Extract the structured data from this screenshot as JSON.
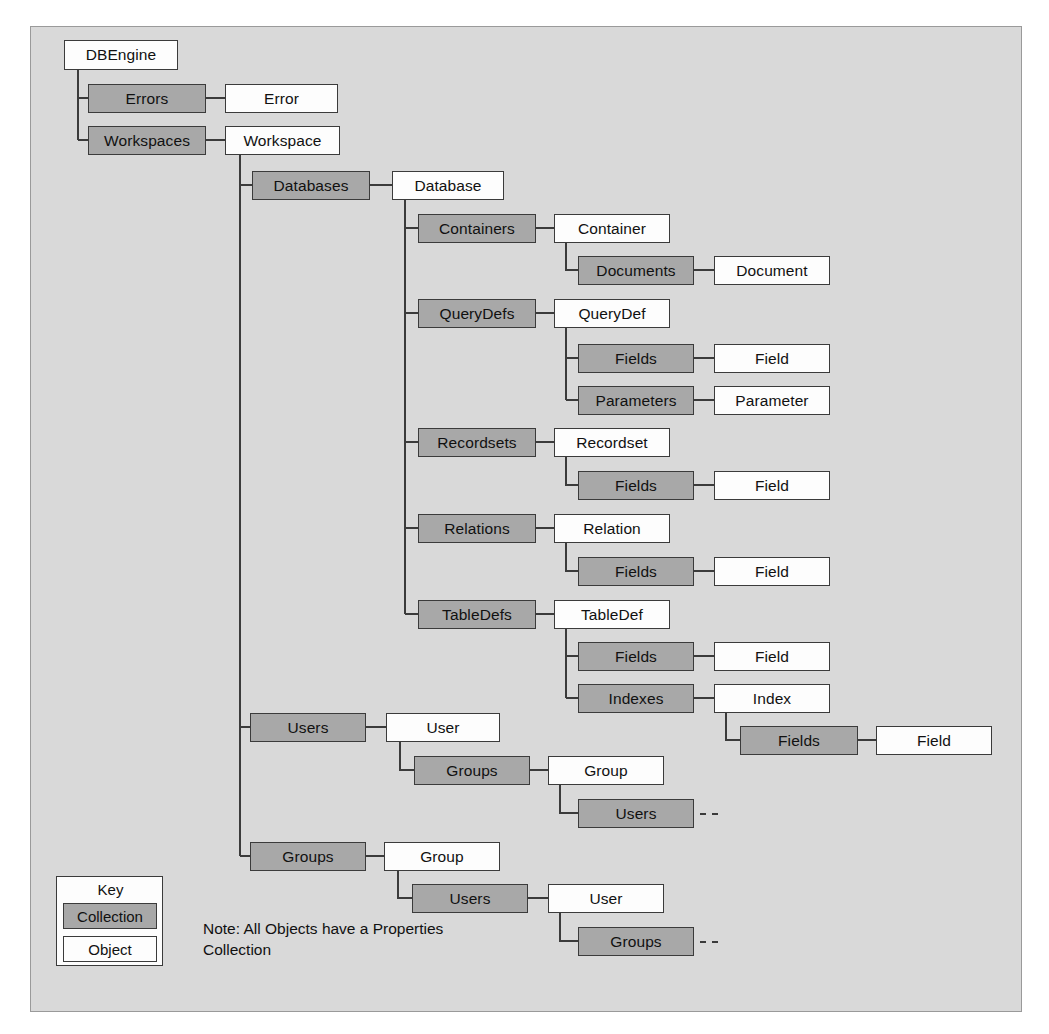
{
  "diagram": {
    "style": {
      "background": "#d9d9d9",
      "collection_fill": "#a8a8a8",
      "object_fill": "#fdfdfd",
      "border": "#3b3b3b"
    },
    "nodes": [
      {
        "id": "dbengine",
        "label": "DBEngine",
        "kind": "object",
        "x": 64,
        "y": 40,
        "w": 114,
        "h": 30
      },
      {
        "id": "errors",
        "label": "Errors",
        "kind": "collection",
        "x": 88,
        "y": 84,
        "w": 118,
        "h": 29
      },
      {
        "id": "error",
        "label": "Error",
        "kind": "object",
        "x": 225,
        "y": 84,
        "w": 113,
        "h": 29
      },
      {
        "id": "workspaces",
        "label": "Workspaces",
        "kind": "collection",
        "x": 88,
        "y": 126,
        "w": 118,
        "h": 29
      },
      {
        "id": "workspace",
        "label": "Workspace",
        "kind": "object",
        "x": 225,
        "y": 126,
        "w": 115,
        "h": 29
      },
      {
        "id": "databases",
        "label": "Databases",
        "kind": "collection",
        "x": 252,
        "y": 171,
        "w": 118,
        "h": 29
      },
      {
        "id": "database",
        "label": "Database",
        "kind": "object",
        "x": 392,
        "y": 171,
        "w": 112,
        "h": 29
      },
      {
        "id": "containers",
        "label": "Containers",
        "kind": "collection",
        "x": 418,
        "y": 214,
        "w": 118,
        "h": 29
      },
      {
        "id": "container",
        "label": "Container",
        "kind": "object",
        "x": 554,
        "y": 214,
        "w": 116,
        "h": 29
      },
      {
        "id": "documents",
        "label": "Documents",
        "kind": "collection",
        "x": 578,
        "y": 256,
        "w": 116,
        "h": 29
      },
      {
        "id": "document",
        "label": "Document",
        "kind": "object",
        "x": 714,
        "y": 256,
        "w": 116,
        "h": 29
      },
      {
        "id": "querydefs",
        "label": "QueryDefs",
        "kind": "collection",
        "x": 418,
        "y": 299,
        "w": 118,
        "h": 29
      },
      {
        "id": "querydef",
        "label": "QueryDef",
        "kind": "object",
        "x": 554,
        "y": 299,
        "w": 116,
        "h": 29
      },
      {
        "id": "qd-fields",
        "label": "Fields",
        "kind": "collection",
        "x": 578,
        "y": 344,
        "w": 116,
        "h": 29
      },
      {
        "id": "qd-field",
        "label": "Field",
        "kind": "object",
        "x": 714,
        "y": 344,
        "w": 116,
        "h": 29
      },
      {
        "id": "parameters",
        "label": "Parameters",
        "kind": "collection",
        "x": 578,
        "y": 386,
        "w": 116,
        "h": 29
      },
      {
        "id": "parameter",
        "label": "Parameter",
        "kind": "object",
        "x": 714,
        "y": 386,
        "w": 116,
        "h": 29
      },
      {
        "id": "recordsets",
        "label": "Recordsets",
        "kind": "collection",
        "x": 418,
        "y": 428,
        "w": 118,
        "h": 29
      },
      {
        "id": "recordset",
        "label": "Recordset",
        "kind": "object",
        "x": 554,
        "y": 428,
        "w": 116,
        "h": 29
      },
      {
        "id": "rs-fields",
        "label": "Fields",
        "kind": "collection",
        "x": 578,
        "y": 471,
        "w": 116,
        "h": 29
      },
      {
        "id": "rs-field",
        "label": "Field",
        "kind": "object",
        "x": 714,
        "y": 471,
        "w": 116,
        "h": 29
      },
      {
        "id": "relations",
        "label": "Relations",
        "kind": "collection",
        "x": 418,
        "y": 514,
        "w": 118,
        "h": 29
      },
      {
        "id": "relation",
        "label": "Relation",
        "kind": "object",
        "x": 554,
        "y": 514,
        "w": 116,
        "h": 29
      },
      {
        "id": "rl-fields",
        "label": "Fields",
        "kind": "collection",
        "x": 578,
        "y": 557,
        "w": 116,
        "h": 29
      },
      {
        "id": "rl-field",
        "label": "Field",
        "kind": "object",
        "x": 714,
        "y": 557,
        "w": 116,
        "h": 29
      },
      {
        "id": "tabledefs",
        "label": "TableDefs",
        "kind": "collection",
        "x": 418,
        "y": 600,
        "w": 118,
        "h": 29
      },
      {
        "id": "tabledef",
        "label": "TableDef",
        "kind": "object",
        "x": 554,
        "y": 600,
        "w": 116,
        "h": 29
      },
      {
        "id": "td-fields",
        "label": "Fields",
        "kind": "collection",
        "x": 578,
        "y": 642,
        "w": 116,
        "h": 29
      },
      {
        "id": "td-field",
        "label": "Field",
        "kind": "object",
        "x": 714,
        "y": 642,
        "w": 116,
        "h": 29
      },
      {
        "id": "indexes",
        "label": "Indexes",
        "kind": "collection",
        "x": 578,
        "y": 684,
        "w": 116,
        "h": 29
      },
      {
        "id": "index",
        "label": "Index",
        "kind": "object",
        "x": 714,
        "y": 684,
        "w": 116,
        "h": 29
      },
      {
        "id": "ix-fields",
        "label": "Fields",
        "kind": "collection",
        "x": 740,
        "y": 726,
        "w": 118,
        "h": 29
      },
      {
        "id": "ix-field",
        "label": "Field",
        "kind": "object",
        "x": 876,
        "y": 726,
        "w": 116,
        "h": 29
      },
      {
        "id": "users",
        "label": "Users",
        "kind": "collection",
        "x": 250,
        "y": 713,
        "w": 116,
        "h": 29
      },
      {
        "id": "user",
        "label": "User",
        "kind": "object",
        "x": 386,
        "y": 713,
        "w": 114,
        "h": 29
      },
      {
        "id": "u-groups",
        "label": "Groups",
        "kind": "collection",
        "x": 414,
        "y": 756,
        "w": 116,
        "h": 29
      },
      {
        "id": "u-group",
        "label": "Group",
        "kind": "object",
        "x": 548,
        "y": 756,
        "w": 116,
        "h": 29
      },
      {
        "id": "ug-users",
        "label": "Users",
        "kind": "collection",
        "x": 578,
        "y": 799,
        "w": 116,
        "h": 29
      },
      {
        "id": "groups",
        "label": "Groups",
        "kind": "collection",
        "x": 250,
        "y": 842,
        "w": 116,
        "h": 29
      },
      {
        "id": "group",
        "label": "Group",
        "kind": "object",
        "x": 384,
        "y": 842,
        "w": 116,
        "h": 29
      },
      {
        "id": "g-users",
        "label": "Users",
        "kind": "collection",
        "x": 412,
        "y": 884,
        "w": 116,
        "h": 29
      },
      {
        "id": "g-user",
        "label": "User",
        "kind": "object",
        "x": 548,
        "y": 884,
        "w": 116,
        "h": 29
      },
      {
        "id": "gu-groups",
        "label": "Groups",
        "kind": "collection",
        "x": 578,
        "y": 927,
        "w": 116,
        "h": 29
      }
    ],
    "legend": {
      "title": "Key",
      "collection_label": "Collection",
      "object_label": "Object"
    },
    "note": "Note: All Objects have a Properties Collection"
  }
}
